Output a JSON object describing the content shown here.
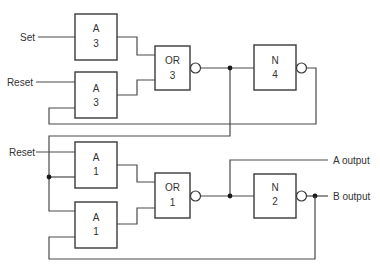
{
  "diagram": {
    "type": "logic-circuit",
    "inputs": {
      "set_label": "Set",
      "reset_top_label": "Reset",
      "reset_bottom_label": "Reset"
    },
    "outputs": {
      "a_output_label": "A output",
      "b_output_label": "B output"
    },
    "gates": {
      "a3_top": {
        "type": "A",
        "num": "3"
      },
      "a3_bottom": {
        "type": "A",
        "num": "3"
      },
      "or3": {
        "type": "OR",
        "num": "3"
      },
      "n4": {
        "type": "N",
        "num": "4"
      },
      "a1_top": {
        "type": "A",
        "num": "1"
      },
      "a1_bottom": {
        "type": "A",
        "num": "1"
      },
      "or1": {
        "type": "OR",
        "num": "1"
      },
      "n2": {
        "type": "N",
        "num": "2"
      }
    },
    "colors": {
      "line": "#4a4a4a",
      "background": "#ffffff"
    }
  }
}
